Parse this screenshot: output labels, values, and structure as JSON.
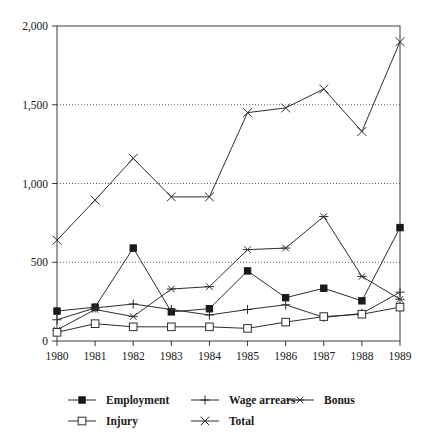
{
  "chart_data": {
    "type": "line",
    "title": "",
    "subtitle": "",
    "xlabel": "",
    "ylabel": "",
    "categories": [
      "1980",
      "1981",
      "1982",
      "1983",
      "1984",
      "1985",
      "1986",
      "1987",
      "1988",
      "1989"
    ],
    "x": [
      1980,
      1981,
      1982,
      1983,
      1984,
      1985,
      1986,
      1987,
      1988,
      1989
    ],
    "ylim": [
      0,
      2000
    ],
    "xlim": [
      1980,
      1989
    ],
    "y_ticks": [
      0,
      500,
      1000,
      1500,
      2000
    ],
    "y_tick_labels": [
      "0",
      "500",
      "1,000",
      "1,500",
      "2,000"
    ],
    "grid": "horizontal-dotted",
    "legend_position": "bottom",
    "series": [
      {
        "name": "Employment",
        "marker": "filled-square",
        "values": [
          190,
          215,
          590,
          185,
          205,
          445,
          275,
          335,
          255,
          720
        ]
      },
      {
        "name": "Wage arrears",
        "marker": "plus",
        "values": [
          135,
          210,
          235,
          200,
          165,
          200,
          230,
          150,
          175,
          310
        ]
      },
      {
        "name": "Bonus",
        "marker": "asterisk",
        "values": [
          70,
          200,
          155,
          330,
          345,
          580,
          590,
          790,
          410,
          265
        ]
      },
      {
        "name": "Injury",
        "marker": "open-square",
        "values": [
          55,
          110,
          90,
          90,
          90,
          80,
          120,
          155,
          170,
          215
        ]
      },
      {
        "name": "Total",
        "marker": "cross",
        "values": [
          640,
          895,
          1160,
          915,
          915,
          1450,
          1480,
          1600,
          1330,
          1900
        ]
      }
    ]
  },
  "legend": {
    "entries": [
      {
        "label": "Employment",
        "marker": "filled-square"
      },
      {
        "label": "Wage arrears",
        "marker": "plus"
      },
      {
        "label": "Bonus",
        "marker": "asterisk"
      },
      {
        "label": "Injury",
        "marker": "open-square"
      },
      {
        "label": "Total",
        "marker": "cross"
      }
    ]
  },
  "colors": {
    "line": "#2e2e2e",
    "text": "#1a1a1a",
    "frame": "#3a3a3a",
    "grid": "#4a4a4a",
    "background": "#ffffff"
  }
}
